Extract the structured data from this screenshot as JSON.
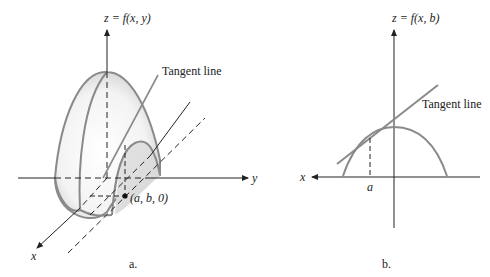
{
  "figure_a": {
    "z_axis_label": "z = f(x, y)",
    "y_axis_label": "y",
    "x_axis_label": "x",
    "tangent_label": "Tangent line",
    "point_label": "(a, b, 0)",
    "caption": "a."
  },
  "figure_b": {
    "z_axis_label": "z = f(x, b)",
    "x_axis_label": "x",
    "tangent_label": "Tangent line",
    "tick_label": "a",
    "caption": "b."
  },
  "colors": {
    "curve": "#8a8a8a",
    "axis": "#222222",
    "surface_shade": "#d8d8d8",
    "background": "#ffffff"
  }
}
